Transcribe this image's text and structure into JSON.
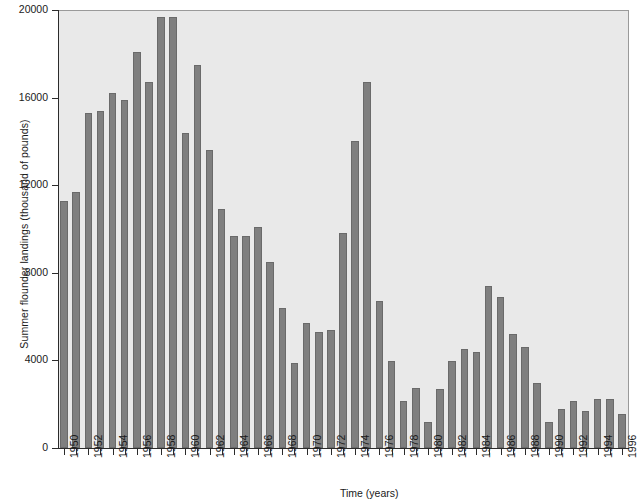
{
  "chart_data": {
    "type": "bar",
    "title": "",
    "xlabel": "Time (years)",
    "ylabel": "Summer flounder landings (thousand of pounds)",
    "ylim": [
      0,
      20000
    ],
    "ytick_labels": [
      "0",
      "4000",
      "8000",
      "12000",
      "16000",
      "20000"
    ],
    "yticks": [
      0,
      4000,
      8000,
      12000,
      16000,
      20000
    ],
    "grid": false,
    "legend": "none",
    "xtick_label_step": 2,
    "categories": [
      "1950",
      "1951",
      "1952",
      "1953",
      "1954",
      "1955",
      "1956",
      "1957",
      "1958",
      "1959",
      "1960",
      "1961",
      "1962",
      "1963",
      "1964",
      "1965",
      "1966",
      "1967",
      "1968",
      "1969",
      "1970",
      "1971",
      "1972",
      "1973",
      "1974",
      "1975",
      "1976",
      "1977",
      "1978",
      "1979",
      "1980",
      "1981",
      "1982",
      "1983",
      "1984",
      "1985",
      "1986",
      "1987",
      "1988",
      "1989",
      "1990",
      "1991",
      "1992",
      "1993",
      "1994",
      "1995",
      "1996"
    ],
    "values": [
      11300,
      11700,
      15300,
      15400,
      16200,
      15900,
      18100,
      16700,
      19700,
      19700,
      14400,
      17500,
      13600,
      10900,
      9700,
      9700,
      10100,
      8500,
      6400,
      3900,
      5700,
      5300,
      5400,
      9800,
      14000,
      16700,
      6700,
      3950,
      2150,
      2750,
      1200,
      2700,
      3950,
      4500,
      4400,
      7400,
      6900,
      5200,
      4600,
      2950,
      1200,
      1800,
      2150,
      1700,
      2250,
      2250,
      1550
    ],
    "bar_color": "#7f7f7f",
    "plot_background": "#e9e9e9",
    "axis_color": "#2b2b2b"
  }
}
